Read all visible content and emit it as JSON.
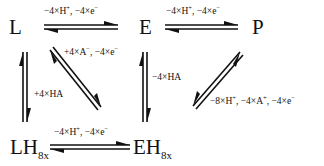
{
  "diagram": {
    "type": "reaction-scheme",
    "nodes": {
      "L": {
        "label": "L"
      },
      "E": {
        "label": "E"
      },
      "P": {
        "label": "P"
      },
      "LH": {
        "label": "LH",
        "subscript": "8x"
      },
      "EH": {
        "label": "EH",
        "subscript": "8x"
      }
    },
    "edges": [
      {
        "from": "L",
        "to": "E",
        "label": "−4×H⁺, −4×e⁻",
        "parts": [
          "−4×H",
          "+",
          ", −4×e",
          "−"
        ],
        "type": "equilibrium"
      },
      {
        "from": "E",
        "to": "P",
        "label": "−4×H⁺, −4×e⁻",
        "parts": [
          "−4×H",
          "+",
          ", −4×e",
          "−"
        ],
        "type": "equilibrium"
      },
      {
        "from": "L",
        "to": "LH",
        "label": "+4×HA",
        "type": "equilibrium"
      },
      {
        "from": "L",
        "to": "EH",
        "label": "+4×A⁻, −4×e⁻",
        "parts": [
          "+4×A",
          "−",
          ", −4×e",
          "−"
        ],
        "type": "equilibrium"
      },
      {
        "from": "E",
        "to": "EH",
        "label": "−4×HA",
        "type": "equilibrium"
      },
      {
        "from": "EH",
        "to": "P",
        "label": "−8×H⁺, −4×A⁺, −4×e⁻",
        "parts": [
          "−8×H",
          "+",
          ", −4×A",
          "+",
          ", −4×e",
          "−"
        ],
        "type": "equilibrium"
      },
      {
        "from": "LH",
        "to": "EH",
        "label": "−4×H⁺, −4×e⁻",
        "parts": [
          "−4×H",
          "+",
          ", −4×e",
          "−"
        ],
        "type": "equilibrium"
      }
    ]
  }
}
